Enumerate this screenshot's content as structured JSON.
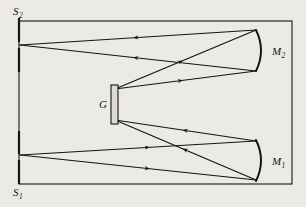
{
  "figure": {
    "kind": "optical-ray-diagram",
    "background_color": "#eceae6",
    "ink_color": "#16140f",
    "frame": {
      "name": "instrument-housing",
      "x": 19,
      "y": 21,
      "width": 273,
      "height": 163,
      "stroke_width": 1.1
    },
    "labels": [
      {
        "id": "S2",
        "base": "S",
        "sub": "2",
        "x": 13,
        "y": 15,
        "target": "exit-slit"
      },
      {
        "id": "S1",
        "base": "S",
        "sub": "1",
        "x": 13,
        "y": 196,
        "target": "entrance-slit"
      },
      {
        "id": "M2",
        "base": "M",
        "sub": "2",
        "x": 272,
        "y": 55,
        "target": "focusing-mirror"
      },
      {
        "id": "M1",
        "base": "M",
        "sub": "1",
        "x": 272,
        "y": 165,
        "target": "collimating-mirror"
      },
      {
        "id": "G",
        "base": "G",
        "sub": "",
        "x": 99,
        "y": 108,
        "target": "diffraction-grating"
      }
    ],
    "slits": [
      {
        "id": "S2",
        "name": "exit-slit",
        "x": 19,
        "top_y": 18,
        "top_end_y": 42,
        "bottom_y": 48,
        "bottom_end_y": 72,
        "stroke_width": 2.2
      },
      {
        "id": "S1",
        "name": "entrance-slit",
        "x": 19,
        "top_y": 131,
        "top_end_y": 154,
        "bottom_y": 160,
        "bottom_end_y": 184,
        "stroke_width": 2.2
      }
    ],
    "mirrors": [
      {
        "id": "M2",
        "name": "focusing-mirror",
        "apex_x": 266,
        "top_x": 256,
        "top_y": 30,
        "bottom_x": 256,
        "bottom_y": 71,
        "stroke_width": 2.0,
        "concave_facing": "left"
      },
      {
        "id": "M1",
        "name": "collimating-mirror",
        "apex_x": 266,
        "top_x": 256,
        "top_y": 140,
        "bottom_x": 256,
        "bottom_y": 181,
        "stroke_width": 2.0,
        "concave_facing": "left"
      }
    ],
    "grating": {
      "id": "G",
      "name": "diffraction-grating",
      "x": 111,
      "y": 85,
      "width": 7,
      "height": 39,
      "stroke_width": 1.1,
      "fill": "#dddad4"
    },
    "rays": [
      {
        "name": "ray-slit1-to-m1-upper",
        "from": [
          20,
          155
        ],
        "to": [
          256,
          141
        ],
        "arrow_t": 0.55,
        "direction": "forward"
      },
      {
        "name": "ray-slit1-to-m1-lower",
        "from": [
          20,
          155
        ],
        "to": [
          256,
          180
        ],
        "arrow_t": 0.55,
        "direction": "forward"
      },
      {
        "name": "ray-m1-to-grating-upper",
        "from": [
          256,
          141
        ],
        "to": [
          115,
          120
        ],
        "arrow_t": 0.52,
        "direction": "forward"
      },
      {
        "name": "ray-m1-to-grating-lower",
        "from": [
          256,
          180
        ],
        "to": [
          115,
          120
        ],
        "arrow_t": 0.52,
        "direction": "forward"
      },
      {
        "name": "ray-grating-to-m2-upper",
        "from": [
          115,
          89
        ],
        "to": [
          256,
          30
        ],
        "arrow_t": 0.48,
        "direction": "forward"
      },
      {
        "name": "ray-grating-to-m2-lower",
        "from": [
          115,
          89
        ],
        "to": [
          256,
          71
        ],
        "arrow_t": 0.48,
        "direction": "forward"
      },
      {
        "name": "ray-m2-to-slit2-upper",
        "from": [
          256,
          30
        ],
        "to": [
          20,
          45
        ],
        "arrow_t": 0.52,
        "direction": "forward"
      },
      {
        "name": "ray-m2-to-slit2-lower",
        "from": [
          256,
          71
        ],
        "to": [
          20,
          45
        ],
        "arrow_t": 0.52,
        "direction": "forward"
      }
    ],
    "ray_stroke_width": 1.25,
    "arrow_size": 5.5
  }
}
